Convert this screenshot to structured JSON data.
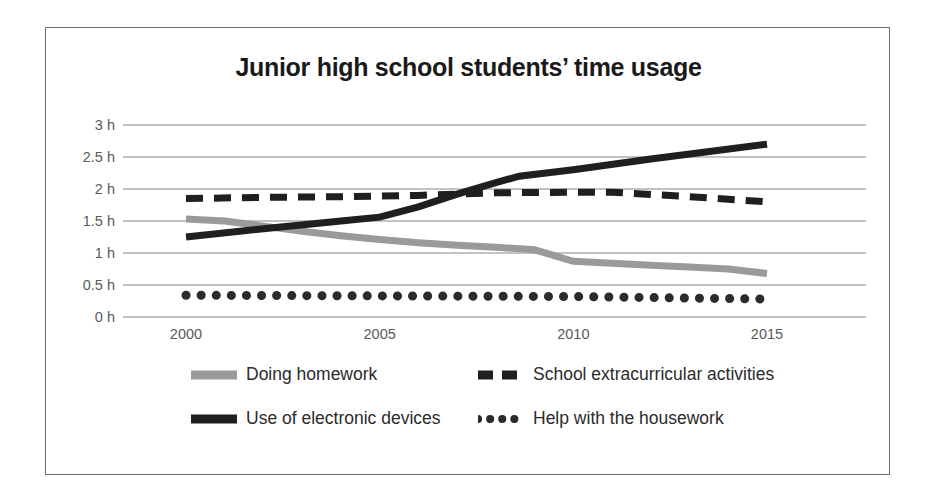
{
  "chart_data": {
    "type": "line",
    "title": "Junior high school students’ time usage",
    "xlabel": "",
    "ylabel": "",
    "grid": true,
    "legend_position": "bottom",
    "x": [
      2000,
      2015
    ],
    "xlim": [
      2000,
      2015
    ],
    "ylim": [
      0,
      3
    ],
    "xtick_labels": [
      "2000",
      "2005",
      "2010",
      "2015"
    ],
    "xtick_values": [
      2000,
      2005,
      2010,
      2015
    ],
    "ytick_labels": [
      "3 h",
      "2.5 h",
      "2 h",
      "1.5 h",
      "1 h",
      "0.5 h",
      "0 h"
    ],
    "ytick_values": [
      3,
      2.5,
      2,
      1.5,
      1,
      0.5,
      0
    ],
    "y_unit": "h",
    "series": [
      {
        "name": "Doing homework",
        "style": "solid",
        "color": "#9a9a9a",
        "points": [
          {
            "x": 2000,
            "y": 1.53
          },
          {
            "x": 2001,
            "y": 1.5
          },
          {
            "x": 2002,
            "y": 1.42
          },
          {
            "x": 2003,
            "y": 1.34
          },
          {
            "x": 2004,
            "y": 1.27
          },
          {
            "x": 2005,
            "y": 1.21
          },
          {
            "x": 2006,
            "y": 1.16
          },
          {
            "x": 2007,
            "y": 1.12
          },
          {
            "x": 2008,
            "y": 1.09
          },
          {
            "x": 2009,
            "y": 1.05
          },
          {
            "x": 2010,
            "y": 0.87
          },
          {
            "x": 2011,
            "y": 0.84
          },
          {
            "x": 2012,
            "y": 0.81
          },
          {
            "x": 2013,
            "y": 0.78
          },
          {
            "x": 2014,
            "y": 0.75
          },
          {
            "x": 2015,
            "y": 0.68
          }
        ]
      },
      {
        "name": "School extracurricular activities",
        "style": "dashed",
        "color": "#1f1f1f",
        "points": [
          {
            "x": 2000,
            "y": 1.85
          },
          {
            "x": 2002,
            "y": 1.87
          },
          {
            "x": 2004,
            "y": 1.88
          },
          {
            "x": 2006,
            "y": 1.9
          },
          {
            "x": 2008,
            "y": 1.94
          },
          {
            "x": 2010,
            "y": 1.95
          },
          {
            "x": 2011,
            "y": 1.95
          },
          {
            "x": 2013,
            "y": 1.88
          },
          {
            "x": 2015,
            "y": 1.8
          }
        ]
      },
      {
        "name": "Use of electronic devices",
        "style": "solid",
        "color": "#1f1f1f",
        "points": [
          {
            "x": 2000,
            "y": 1.25
          },
          {
            "x": 2002,
            "y": 1.38
          },
          {
            "x": 2004,
            "y": 1.5
          },
          {
            "x": 2005,
            "y": 1.56
          },
          {
            "x": 2006,
            "y": 1.72
          },
          {
            "x": 2007,
            "y": 1.92
          },
          {
            "x": 2008,
            "y": 2.1
          },
          {
            "x": 2008.6,
            "y": 2.2
          },
          {
            "x": 2010,
            "y": 2.3
          },
          {
            "x": 2012,
            "y": 2.47
          },
          {
            "x": 2015,
            "y": 2.7
          }
        ]
      },
      {
        "name": "Help with the housework",
        "style": "dotted",
        "color": "#2b2b2b",
        "points": [
          {
            "x": 2000,
            "y": 0.34
          },
          {
            "x": 2005,
            "y": 0.33
          },
          {
            "x": 2010,
            "y": 0.32
          },
          {
            "x": 2015,
            "y": 0.28
          }
        ]
      }
    ]
  },
  "legend": {
    "items": [
      {
        "label": "Doing homework",
        "style": "solid",
        "color": "#9a9a9a"
      },
      {
        "label": "School extracurricular activities",
        "style": "dashed",
        "color": "#1f1f1f"
      },
      {
        "label": "Use of electronic devices",
        "style": "solid",
        "color": "#1f1f1f"
      },
      {
        "label": "Help with the housework",
        "style": "dotted",
        "color": "#2b2b2b"
      }
    ]
  },
  "colors": {
    "gridline": "#888888",
    "frame": "#6e6e6e",
    "tick_text": "#5a5a5a",
    "title_text": "#1a1a1a",
    "background": "#ffffff"
  }
}
